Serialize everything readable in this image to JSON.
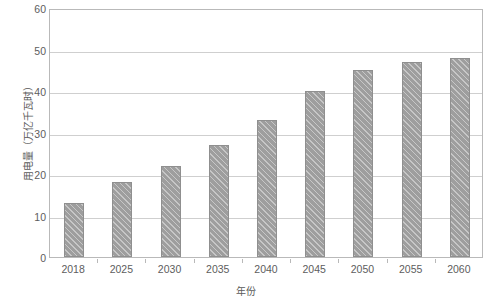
{
  "chart_data": {
    "type": "bar",
    "title": "",
    "xlabel": "年份",
    "ylabel": "用电量（万亿千瓦时）",
    "categories": [
      "2018",
      "2025",
      "2030",
      "2035",
      "2040",
      "2045",
      "2050",
      "2055",
      "2060"
    ],
    "values": [
      13,
      18,
      22,
      27,
      33,
      40,
      45,
      47,
      48
    ],
    "ylim": [
      0,
      60
    ],
    "ytick_labels": [
      "0",
      "10",
      "20",
      "30",
      "40",
      "50",
      "60"
    ],
    "ytick_values": [
      0,
      10,
      20,
      30,
      40,
      50,
      60
    ],
    "grid": "horizontal",
    "legend": "none",
    "bar_color": "#9e9e9e",
    "bar_pattern": "diagonal-hatch",
    "axis_color": "#b9b9b9",
    "grid_color": "#cfcfcf",
    "text_color": "#5d5d5d",
    "background": "#ffffff"
  }
}
